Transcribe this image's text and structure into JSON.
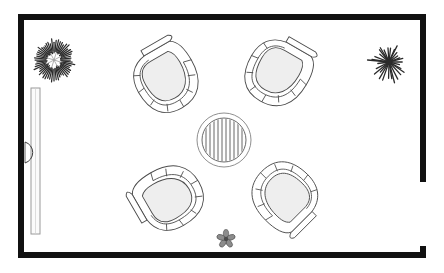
{
  "document": {
    "type": "architectural-floor-plan",
    "title": "Lounge seating plan",
    "view": "plan",
    "canvas": {
      "width": 444,
      "height": 273
    },
    "background_color": "#ffffff"
  },
  "colors": {
    "wall": "#111111",
    "furniture_outline": "#4a4a4a",
    "furniture_fill": "#eeeeee",
    "table_hatch": "#555555",
    "plant": "#2b2b2b",
    "glass_panel": "#fbfbfb",
    "paper": "#ffffff"
  },
  "room": {
    "name": "lounge-room",
    "outline": {
      "x": 18,
      "y": 14,
      "width": 408,
      "height": 244
    },
    "wall_thickness": 6,
    "walls": [
      {
        "name": "wall-top",
        "orientation": "horizontal",
        "x": 18,
        "y": 14,
        "length": 408,
        "thickness": 6
      },
      {
        "name": "wall-left",
        "orientation": "vertical",
        "x": 18,
        "y": 14,
        "length": 244,
        "thickness": 6
      },
      {
        "name": "wall-bottom",
        "orientation": "horizontal",
        "x": 18,
        "y": 252,
        "length": 408,
        "thickness": 6
      },
      {
        "name": "wall-right-upper",
        "orientation": "vertical",
        "x": 420,
        "y": 14,
        "length": 168,
        "thickness": 6
      },
      {
        "name": "wall-right-stub",
        "orientation": "vertical",
        "x": 420,
        "y": 246,
        "length": 12,
        "thickness": 6
      }
    ],
    "openings": [
      {
        "name": "opening-right-wall",
        "orientation": "vertical",
        "x": 420,
        "y": 182,
        "length": 64
      }
    ]
  },
  "glass_partition": {
    "name": "glass-partition-left",
    "x": 31,
    "y": 88,
    "width": 9,
    "height": 146,
    "label": "glazed partition"
  },
  "door": {
    "name": "door-left-wall",
    "hinge_x": 24,
    "hinge_y": 152,
    "swing_radius": 11,
    "swing_direction": "inward",
    "label": "single door"
  },
  "furniture": {
    "table": {
      "name": "round-coffee-table",
      "shape": "circle",
      "cx": 224,
      "cy": 140,
      "outer_radius": 27,
      "inner_radius": 22,
      "hatch": "vertical-slats",
      "hatch_count": 11,
      "label": "round table"
    },
    "chairs": [
      {
        "name": "tub-chair-top-left",
        "cx": 170,
        "cy": 79,
        "rotation": 150,
        "label": "tub armchair"
      },
      {
        "name": "tub-chair-top-right",
        "cx": 279,
        "cy": 76,
        "rotation": 210,
        "label": "tub armchair"
      },
      {
        "name": "tub-chair-bottom-left",
        "cx": 170,
        "cy": 194,
        "rotation": 60,
        "label": "tub armchair"
      },
      {
        "name": "tub-chair-bottom-right",
        "cx": 281,
        "cy": 196,
        "rotation": 315,
        "label": "tub armchair"
      }
    ]
  },
  "plants": [
    {
      "name": "plant-shrub-top-left",
      "style": "bushy-shrub",
      "cx": 54,
      "cy": 60,
      "radius": 19,
      "spikes": 56,
      "label": "shrub"
    },
    {
      "name": "plant-spiky-top-right",
      "style": "spiky-starburst",
      "cx": 389,
      "cy": 62,
      "radius": 19,
      "spikes": 30,
      "label": "spiky plant"
    },
    {
      "name": "plant-flower-bottom-center",
      "style": "small-flower",
      "cx": 226,
      "cy": 239,
      "radius": 9,
      "petals": 5,
      "label": "potted flower"
    }
  ]
}
